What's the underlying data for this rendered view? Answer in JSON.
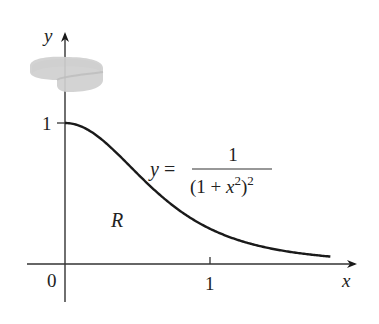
{
  "figure": {
    "axis_labels": {
      "x": "x",
      "y": "y"
    },
    "ticks": {
      "origin": "0",
      "x_one": "1",
      "y_one": "1"
    },
    "region_label": "R",
    "equation": {
      "lhs": "y =",
      "numerator": "1",
      "denominator_base": "(1 + x",
      "denominator_inner_exp": "2",
      "denominator_close": ")",
      "denominator_outer_exp": "2"
    },
    "colors": {
      "ink": "#1a1a1a",
      "ring": "#c8c8c8"
    }
  }
}
